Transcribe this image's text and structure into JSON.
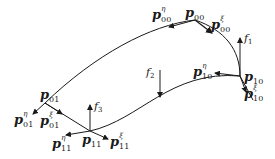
{
  "diagram": {
    "type": "bicubic surface patch with corner points, tangent vectors and forces",
    "corners": {
      "p00": {
        "base": "p",
        "sub": "00"
      },
      "p10": {
        "base": "p",
        "sub": "10"
      },
      "p01": {
        "base": "p",
        "sub": "01"
      },
      "p11": {
        "base": "p",
        "sub": "11"
      }
    },
    "tangents": {
      "p00_eta": {
        "base": "p",
        "sub": "00",
        "sup": "η"
      },
      "p00_xi": {
        "base": "p",
        "sub": "00",
        "sup": "ξ"
      },
      "p10_eta": {
        "base": "p",
        "sub": "10",
        "sup": "η"
      },
      "p10_xi": {
        "base": "p",
        "sub": "10",
        "sup": "ξ"
      },
      "p01_eta": {
        "base": "p",
        "sub": "01",
        "sup": "η"
      },
      "p01_xi": {
        "base": "p",
        "sub": "01",
        "sup": "ξ"
      },
      "p11_eta": {
        "base": "p",
        "sub": "11",
        "sup": "η"
      },
      "p11_xi": {
        "base": "p",
        "sub": "11",
        "sup": "ξ"
      }
    },
    "forces": {
      "f1": {
        "base": "f",
        "sub": "1"
      },
      "f2": {
        "base": "f",
        "sub": "2"
      },
      "f3": {
        "base": "f",
        "sub": "3"
      }
    },
    "colors": {
      "stroke": "#1a1a1a",
      "background": "#ffffff"
    }
  }
}
